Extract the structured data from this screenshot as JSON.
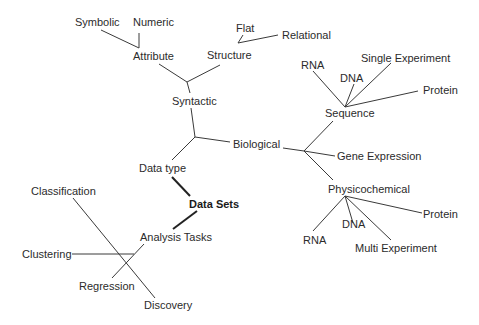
{
  "diagram": {
    "title": "Data Sets",
    "root": "data-sets",
    "nodes": [
      {
        "id": "data-sets",
        "label": "Data Sets",
        "x": 189,
        "y": 198,
        "bold": true
      },
      {
        "id": "data-type",
        "label": "Data type",
        "x": 139,
        "y": 162
      },
      {
        "id": "analysis-tasks",
        "label": "Analysis Tasks",
        "x": 140,
        "y": 231
      },
      {
        "id": "syntactic",
        "label": "Syntactic",
        "x": 172,
        "y": 95
      },
      {
        "id": "biological",
        "label": "Biological",
        "x": 233,
        "y": 138
      },
      {
        "id": "attribute",
        "label": "Attribute",
        "x": 133,
        "y": 50
      },
      {
        "id": "structure",
        "label": "Structure",
        "x": 207,
        "y": 49
      },
      {
        "id": "symbolic",
        "label": "Symbolic",
        "x": 75,
        "y": 16
      },
      {
        "id": "numeric",
        "label": "Numeric",
        "x": 133,
        "y": 16
      },
      {
        "id": "flat",
        "label": "Flat",
        "x": 236,
        "y": 22
      },
      {
        "id": "relational",
        "label": "Relational",
        "x": 282,
        "y": 29
      },
      {
        "id": "sequence",
        "label": "Sequence",
        "x": 325,
        "y": 107
      },
      {
        "id": "gene-expression",
        "label": "Gene Expression",
        "x": 337,
        "y": 150
      },
      {
        "id": "physicochemical",
        "label": "Physicochemical",
        "x": 328,
        "y": 183
      },
      {
        "id": "seq-rna",
        "label": "RNA",
        "x": 301,
        "y": 59
      },
      {
        "id": "seq-dna",
        "label": "DNA",
        "x": 340,
        "y": 72
      },
      {
        "id": "seq-single-experiment",
        "label": "Single Experiment",
        "x": 361,
        "y": 52
      },
      {
        "id": "seq-protein",
        "label": "Protein",
        "x": 423,
        "y": 84
      },
      {
        "id": "phys-protein",
        "label": "Protein",
        "x": 423,
        "y": 208
      },
      {
        "id": "phys-dna",
        "label": "DNA",
        "x": 342,
        "y": 218
      },
      {
        "id": "phys-rna",
        "label": "RNA",
        "x": 303,
        "y": 234
      },
      {
        "id": "phys-multi-experiment",
        "label": "Multi Experiment",
        "x": 355,
        "y": 242
      },
      {
        "id": "classification",
        "label": "Classification",
        "x": 31,
        "y": 185
      },
      {
        "id": "clustering",
        "label": "Clustering",
        "x": 22,
        "y": 248
      },
      {
        "id": "regression",
        "label": "Regression",
        "x": 79,
        "y": 280
      },
      {
        "id": "discovery",
        "label": "Discovery",
        "x": 144,
        "y": 299
      }
    ],
    "edges": [
      {
        "from": [
          101,
          30
        ],
        "to": [
          139,
          48
        ]
      },
      {
        "from": [
          139,
          33
        ],
        "to": [
          139,
          48
        ]
      },
      {
        "from": [
          159,
          64
        ],
        "to": [
          187,
          82
        ]
      },
      {
        "from": [
          220,
          65
        ],
        "to": [
          187,
          82
        ]
      },
      {
        "from": [
          187,
          82
        ],
        "to": [
          190,
          93
        ]
      },
      {
        "from": [
          191,
          108
        ],
        "to": [
          195,
          137
        ]
      },
      {
        "from": [
          195,
          137
        ],
        "to": [
          230,
          142
        ]
      },
      {
        "from": [
          195,
          137
        ],
        "to": [
          172,
          160
        ]
      },
      {
        "from": [
          172,
          177
        ],
        "to": [
          190,
          196
        ],
        "thick": true
      },
      {
        "from": [
          197,
          211
        ],
        "to": [
          173,
          229
        ],
        "thick": true
      },
      {
        "from": [
          238,
          43
        ],
        "to": [
          243,
          35
        ]
      },
      {
        "from": [
          238,
          43
        ],
        "to": [
          278,
          35
        ]
      },
      {
        "from": [
          283,
          148
        ],
        "to": [
          304,
          151
        ]
      },
      {
        "from": [
          304,
          151
        ],
        "to": [
          333,
          121
        ]
      },
      {
        "from": [
          304,
          151
        ],
        "to": [
          335,
          156
        ]
      },
      {
        "from": [
          304,
          151
        ],
        "to": [
          333,
          180
        ]
      },
      {
        "from": [
          345,
          107
        ],
        "to": [
          313,
          71
        ]
      },
      {
        "from": [
          345,
          107
        ],
        "to": [
          354,
          84
        ]
      },
      {
        "from": [
          345,
          107
        ],
        "to": [
          391,
          63
        ]
      },
      {
        "from": [
          345,
          107
        ],
        "to": [
          418,
          91
        ]
      },
      {
        "from": [
          345,
          196
        ],
        "to": [
          313,
          231
        ]
      },
      {
        "from": [
          345,
          196
        ],
        "to": [
          353,
          223
        ]
      },
      {
        "from": [
          345,
          196
        ],
        "to": [
          391,
          240
        ]
      },
      {
        "from": [
          345,
          196
        ],
        "to": [
          422,
          213
        ]
      },
      {
        "from": [
          73,
          198
        ],
        "to": [
          155,
          298
        ]
      },
      {
        "from": [
          72,
          254
        ],
        "to": [
          134,
          254
        ]
      },
      {
        "from": [
          112,
          278
        ],
        "to": [
          144,
          244
        ]
      }
    ]
  }
}
